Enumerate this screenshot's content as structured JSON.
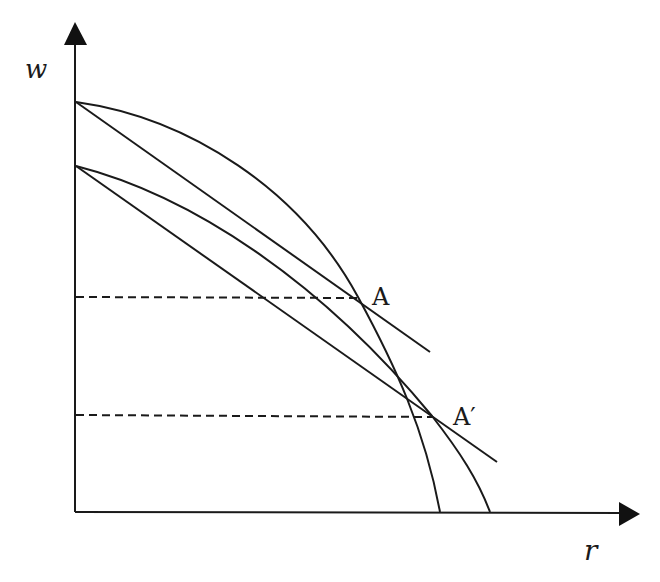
{
  "diagram": {
    "type": "economics-factor-price-frontier",
    "axes": {
      "y_label": "w",
      "x_label": "r"
    },
    "points": [
      {
        "label": "A",
        "x": 358,
        "y": 297
      },
      {
        "label": "A′",
        "x": 432,
        "y": 416
      }
    ],
    "curves": [
      {
        "name": "upper-frontier-curve",
        "from": [
          76,
          102
        ],
        "to": [
          440,
          512
        ],
        "concave": true
      },
      {
        "name": "lower-frontier-curve",
        "from": [
          76,
          166
        ],
        "to": [
          490,
          512
        ],
        "concave": true
      }
    ],
    "lines": [
      {
        "name": "upper-tangent-line",
        "from": [
          76,
          102
        ],
        "to": [
          430,
          352
        ]
      },
      {
        "name": "lower-tangent-line",
        "from": [
          76,
          166
        ],
        "to": [
          497,
          462
        ]
      }
    ],
    "guides": [
      {
        "name": "dashed-guide-A",
        "y": 297,
        "from_x": 76,
        "to_x": 358
      },
      {
        "name": "dashed-guide-A-prime",
        "y": 416,
        "from_x": 76,
        "to_x": 432
      }
    ],
    "colors": {
      "stroke": "#1a1a1a",
      "background": "#ffffff"
    }
  }
}
